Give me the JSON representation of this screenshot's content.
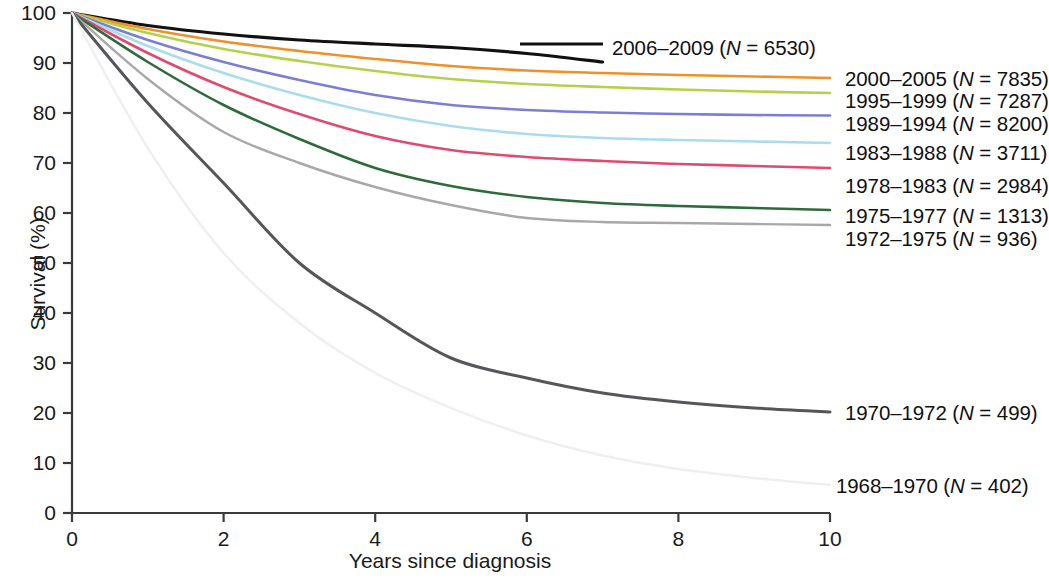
{
  "chart_data": {
    "type": "line",
    "title": "",
    "xlabel": "Years since diagnosis",
    "ylabel": "Survival (%)",
    "xlim": [
      0,
      10
    ],
    "ylim": [
      0,
      100
    ],
    "xticks": [
      0,
      2,
      4,
      6,
      8,
      10
    ],
    "yticks": [
      0,
      10,
      20,
      30,
      40,
      50,
      60,
      70,
      80,
      90,
      100
    ],
    "grid": false,
    "legend_position": "right-inline-labels",
    "x": [
      0,
      1,
      2,
      3,
      4,
      5,
      6,
      7,
      8,
      9,
      10
    ],
    "series": [
      {
        "name": "2006-2009",
        "n": 6530,
        "label": "2006–2009 (N = 6530)",
        "color": "#111111",
        "width": 3.2,
        "values": [
          100,
          97.5,
          95.8,
          94.6,
          93.8,
          93.1,
          91.9,
          90.2,
          null,
          null,
          null
        ]
      },
      {
        "name": "2000-2005",
        "n": 7835,
        "label": "2000–2005 (N = 7835)",
        "color": "#ef9126",
        "width": 2.6,
        "values": [
          100,
          96.8,
          94.3,
          92.4,
          90.8,
          89.4,
          88.5,
          88.0,
          87.6,
          87.3,
          87.0
        ]
      },
      {
        "name": "1995-1999",
        "n": 7287,
        "label": "1995–1999 (N = 7287)",
        "color": "#b5d14a",
        "width": 2.6,
        "values": [
          100,
          96.0,
          92.8,
          90.4,
          88.4,
          86.8,
          85.8,
          85.2,
          84.7,
          84.3,
          84.0
        ]
      },
      {
        "name": "1989-1994",
        "n": 8200,
        "label": "1989–1994 (N = 8200)",
        "color": "#7b7fd4",
        "width": 2.6,
        "values": [
          100,
          94.6,
          90.2,
          86.6,
          83.6,
          81.6,
          80.6,
          80.1,
          79.8,
          79.6,
          79.5
        ]
      },
      {
        "name": "1983-1988",
        "n": 3711,
        "label": "1983–1988 (N = 3711)",
        "color": "#aadcf0",
        "width": 2.6,
        "values": [
          100,
          93.4,
          88.0,
          83.6,
          80.0,
          77.4,
          75.8,
          75.0,
          74.6,
          74.3,
          74.0
        ]
      },
      {
        "name": "1978-1983",
        "n": 2984,
        "label": "1978–1983 (N = 2984)",
        "color": "#e04a6e",
        "width": 2.6,
        "values": [
          100,
          92.0,
          85.2,
          79.8,
          75.4,
          72.6,
          71.2,
          70.4,
          69.8,
          69.4,
          69.0
        ]
      },
      {
        "name": "1975-1977",
        "n": 1313,
        "label": "1975–1977 (N = 1313)",
        "color": "#2e6b3c",
        "width": 2.6,
        "values": [
          100,
          90.2,
          81.6,
          74.8,
          69.0,
          65.4,
          63.2,
          62.0,
          61.4,
          61.0,
          60.6
        ]
      },
      {
        "name": "1972-1975",
        "n": 936,
        "label": "1972–1975 (N = 936)",
        "color": "#a8a8a8",
        "width": 2.4,
        "values": [
          100,
          86.8,
          76.2,
          70.0,
          65.2,
          61.6,
          59.0,
          58.2,
          58.0,
          57.8,
          57.6
        ]
      },
      {
        "name": "1970-1972",
        "n": 499,
        "label": "1970–1972 (N = 499)",
        "color": "#55565a",
        "width": 3.0,
        "values": [
          100,
          82.0,
          66.0,
          50.0,
          40.0,
          31.0,
          27.0,
          24.0,
          22.2,
          21.0,
          20.2
        ]
      },
      {
        "name": "1968-1970",
        "n": 402,
        "label": "1968–1970 (N = 402)",
        "color": "#efefef",
        "width": 2.4,
        "values": [
          100,
          73.0,
          52.0,
          38.0,
          28.0,
          21.0,
          15.5,
          11.5,
          8.8,
          7.0,
          5.6
        ]
      }
    ],
    "inline_labels": [
      {
        "text": "2006–2009 (N = 6530)",
        "x": 612,
        "y": 48,
        "rule": {
          "x1": 520,
          "x2": 603,
          "y": 44
        }
      },
      {
        "text": "2000–2005 (N = 7835)",
        "x": 845,
        "y": 79,
        "rule": null
      },
      {
        "text": "1995–1999 (N = 7287)",
        "x": 845,
        "y": 101,
        "rule": null
      },
      {
        "text": "1989–1994 (N = 8200)",
        "x": 845,
        "y": 124,
        "rule": null
      },
      {
        "text": "1983–1988 (N = 3711)",
        "x": 845,
        "y": 153,
        "rule": null
      },
      {
        "text": "1978–1983 (N = 2984)",
        "x": 845,
        "y": 186,
        "rule": null
      },
      {
        "text": "1975–1977 (N = 1313)",
        "x": 845,
        "y": 216,
        "rule": null
      },
      {
        "text": "1972–1975 (N = 936)",
        "x": 845,
        "y": 239,
        "rule": null
      },
      {
        "text": "1970–1972 (N = 499)",
        "x": 845,
        "y": 413,
        "rule": null
      },
      {
        "text": "1968–1970 (N = 402)",
        "x": 836,
        "y": 486,
        "rule": null
      }
    ]
  },
  "axes": {
    "y_title": "Survival (%)",
    "x_title": "Years since diagnosis",
    "y_tick_labels": [
      "100",
      "90",
      "80",
      "70",
      "60",
      "50",
      "40",
      "30",
      "20",
      "10",
      "0"
    ],
    "x_tick_labels": [
      "0",
      "2",
      "4",
      "6",
      "8",
      "10"
    ]
  }
}
